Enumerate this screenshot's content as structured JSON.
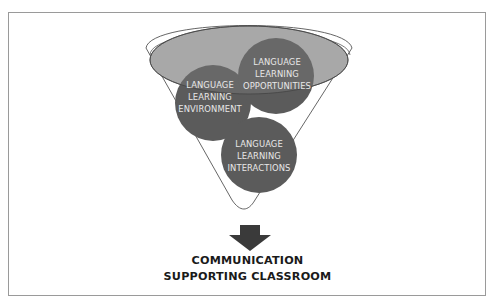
{
  "diagram": {
    "type": "funnel",
    "inputs": [
      {
        "id": "environment",
        "lines": [
          "LANGUAGE",
          "LEARNING",
          "ENVIRONMENT"
        ]
      },
      {
        "id": "opportunities",
        "lines": [
          "LANGUAGE",
          "LEARNING",
          "OPPORTUNITIES"
        ]
      },
      {
        "id": "interactions",
        "lines": [
          "LANGUAGE",
          "LEARNING",
          "INTERACTIONS"
        ]
      }
    ],
    "output": {
      "lines": [
        "COMMUNICATION",
        "SUPPORTING CLASSROOM"
      ]
    },
    "colors": {
      "circle_fill": "#5b5b5b",
      "ellipse_fill": "#a9a9a9",
      "funnel_stroke": "#555555",
      "arrow_fill": "#3a3a3a",
      "label_text": "#e8e8e8",
      "output_text": "#1a1a1a"
    }
  }
}
